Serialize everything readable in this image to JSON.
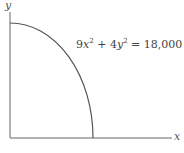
{
  "diagram": {
    "axis_labels": {
      "x": "x",
      "y": "y"
    },
    "equation": {
      "coef_x": "9",
      "var_x": "x",
      "exp_x": "2",
      "plus": " + ",
      "coef_y": "4",
      "var_y": "y",
      "exp_y": "2",
      "rhs": " = 18,000"
    },
    "curve": {
      "type": "quarter-ellipse",
      "x_intercept": 44.7,
      "y_intercept": 67.1,
      "color": "#555555"
    },
    "axis_color": "#666666"
  }
}
